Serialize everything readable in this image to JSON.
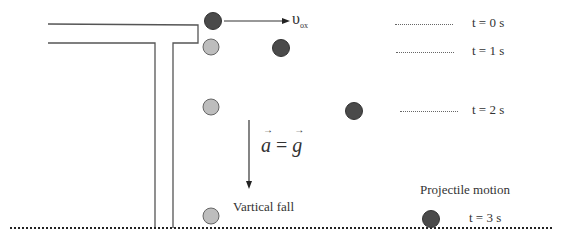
{
  "diagram": {
    "type": "physics-kinematics",
    "velocity_label": {
      "symbol": "υ",
      "subscript": "ox"
    },
    "acceleration_label": {
      "lhs": "a",
      "eq": "=",
      "rhs": "g"
    },
    "time_labels": [
      {
        "text": "t = 0 s"
      },
      {
        "text": "t = 1 s"
      },
      {
        "text": "t = 2 s"
      },
      {
        "text": "t = 3 s"
      }
    ],
    "captions": {
      "vertical": "Vartical fall",
      "projectile": "Projectile motion"
    },
    "colors": {
      "projectile_ball": "#4a4a4a",
      "falling_ball": "#bdbdbd",
      "line": "#555555",
      "ground": "#222222"
    },
    "balls": {
      "projectile": [
        {
          "t": 0,
          "x": 213,
          "y": 21
        },
        {
          "t": 1,
          "x": 281,
          "y": 48
        },
        {
          "t": 2,
          "x": 354,
          "y": 111
        },
        {
          "t": 3,
          "x": 431,
          "y": 219
        }
      ],
      "falling": [
        {
          "t": 1,
          "x": 211,
          "y": 47
        },
        {
          "t": 2,
          "x": 211,
          "y": 107
        },
        {
          "t": 3,
          "x": 211,
          "y": 216
        }
      ]
    }
  }
}
